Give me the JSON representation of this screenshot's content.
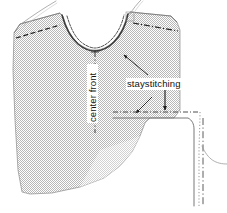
{
  "figure": {
    "kind": "sewing-pattern-illustration",
    "canvas": {
      "width": 227,
      "height": 213
    }
  },
  "labels": {
    "center_front": "center front",
    "staystitching": "staystitching"
  },
  "colors": {
    "fabric_fill": "#bfbfbf",
    "fabric_fill_light": "#d4d4d4",
    "outline": "#555555",
    "stitch_line": "#2b2b2b",
    "label_text": "#111111",
    "background": "#ffffff",
    "detail_line": "#6a6a6a"
  },
  "elements": {
    "fabric_piece": "front-bodice-fabric",
    "neckline_curve": "scooped-neckline-cut-edge",
    "neckline_staystitch": "neckline-staystitch-line",
    "left_shoulder_stitch": "left-shoulder-dashed-stitch",
    "right_shoulder_stitch": "right-shoulder-dashdot-stitch",
    "center_front_fold": "center-front-dashdot-fold-line",
    "thread_tail_left": "left-shoulder-thread-tail",
    "thread_tail_right": "right-shoulder-thread-tail",
    "leader_to_neckline": "staystitching-leader-line-neckline",
    "leader_to_corner": "staystitching-leader-line-corner",
    "arrow_down": "staystitching-down-arrow",
    "corner_detail": "enlarged-corner-seam-detail",
    "corner_seam_allowance": "corner-dotted-seam-allowance",
    "corner_stitch_line": "corner-solid-stitch-line",
    "detail_center_line": "detail-dashdot-center-line",
    "detail_thread": "detail-curved-thread"
  }
}
